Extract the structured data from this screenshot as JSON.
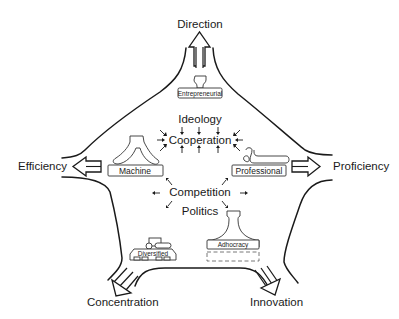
{
  "diagram": {
    "type": "pentagon force diagram of organizational configurations",
    "directions": {
      "top": "Direction",
      "left": "Efficiency",
      "right": "Proficiency",
      "bottom_left": "Concentration",
      "bottom_right": "Innovation"
    },
    "forces": {
      "ideology": "Ideology",
      "cooperation": "Cooperation",
      "competition": "Competition",
      "politics": "Politics"
    },
    "configurations": {
      "entrepreneurial": "Entrepreneurial",
      "machine": "Machine",
      "professional": "Professional",
      "diversified": "Diversified",
      "adhocracy": "Adhocracy"
    },
    "colors": {
      "stroke": "#1a1a1a",
      "background": "#ffffff"
    }
  }
}
